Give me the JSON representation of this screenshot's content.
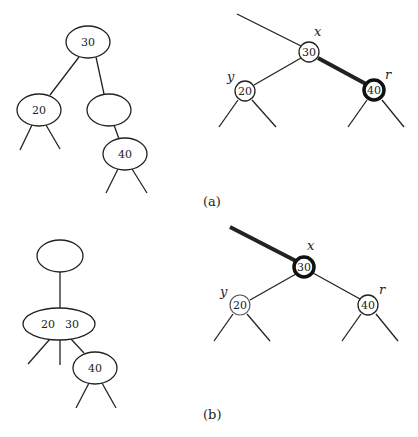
{
  "figure": {
    "panel_a": {
      "caption": "(a)",
      "tree_234": {
        "root": "30",
        "left": "20",
        "middle_empty": "",
        "child_of_empty": "40"
      },
      "red_black": {
        "x_label": "x",
        "y_label": "y",
        "r_label": "r",
        "x_value": "30",
        "y_value": "20",
        "r_value": "40",
        "bold_edge": "x-r",
        "bold_node": "r"
      }
    },
    "panel_b": {
      "caption": "(b)",
      "tree_234": {
        "root_empty": "",
        "merged_left": "20",
        "merged_right": "30",
        "child": "40"
      },
      "red_black": {
        "x_label": "x",
        "y_label": "y",
        "r_label": "r",
        "x_value": "30",
        "y_value": "20",
        "r_value": "40",
        "bold_edge": "parent-x",
        "bold_node": "x"
      }
    }
  }
}
